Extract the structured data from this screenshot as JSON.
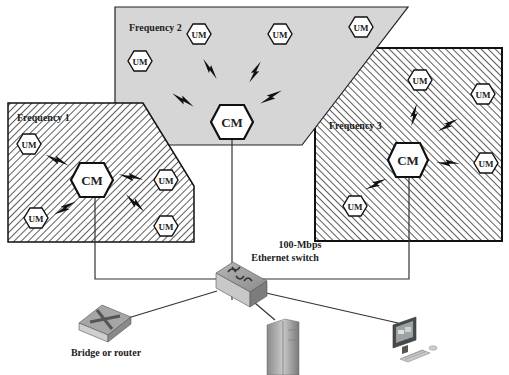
{
  "diagram": {
    "type": "network-topology",
    "zones": [
      {
        "id": "freq1",
        "label": "Frequency 1",
        "fill": "hatched-back",
        "controller": "CM",
        "units": [
          "UM",
          "UM",
          "UM",
          "UM"
        ]
      },
      {
        "id": "freq2",
        "label": "Frequency 2",
        "fill": "#d6d6d6",
        "controller": "CM",
        "units": [
          "UM",
          "UM",
          "UM",
          "UM"
        ]
      },
      {
        "id": "freq3",
        "label": "Frequency 3",
        "fill": "hatched-forward",
        "controller": "CM",
        "units": [
          "UM",
          "UM",
          "UM",
          "UM"
        ]
      }
    ],
    "node_labels": {
      "cm": "CM",
      "um": "UM"
    },
    "switch": {
      "label_line1": "100-Mbps",
      "label_line2": "Ethernet switch"
    },
    "devices": [
      {
        "id": "bridge",
        "label": "Bridge or router"
      },
      {
        "id": "server",
        "label": ""
      },
      {
        "id": "workstation",
        "label": ""
      }
    ],
    "colors": {
      "zone2_fill": "#d6d6d6",
      "outline": "#111111",
      "hatch": "#333333",
      "device_gray": "#9a9a9a"
    }
  }
}
